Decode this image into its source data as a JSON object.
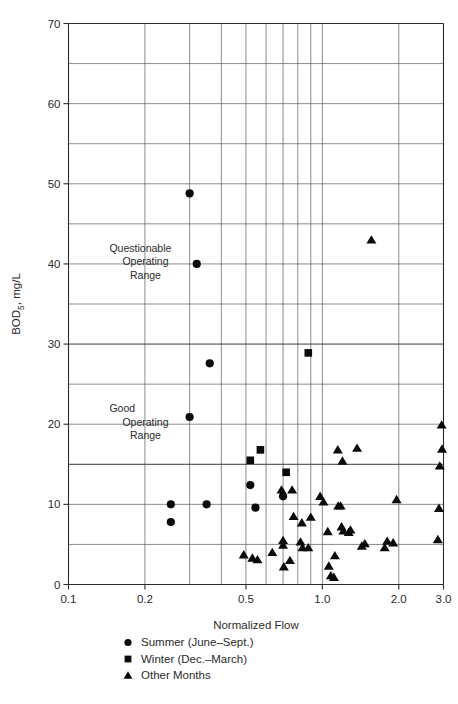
{
  "chart_data": {
    "type": "scatter",
    "title": "",
    "xlabel": "Normalized Flow",
    "ylabel": "BOD5, mg/L",
    "ylabel_display": "BOD₅, mg/L",
    "xscale": "log",
    "yscale": "linear",
    "xlim": [
      0.1,
      3.0
    ],
    "ylim": [
      0,
      70
    ],
    "grid": true,
    "legend_position": "below-axis-center",
    "x_tick_labels": [
      "0.1",
      "0.2",
      "0.5",
      "1.0",
      "2.0",
      "3.0"
    ],
    "x_tick_values": [
      0.1,
      0.2,
      0.5,
      1.0,
      2.0,
      3.0
    ],
    "x_gridline_values": [
      0.1,
      0.2,
      0.3,
      0.4,
      0.5,
      0.6,
      0.7,
      0.8,
      0.9,
      1.0,
      2.0,
      3.0
    ],
    "y_tick_labels": [
      "0",
      "10",
      "20",
      "30",
      "40",
      "50",
      "60",
      "70"
    ],
    "y_tick_values": [
      0,
      10,
      20,
      30,
      40,
      50,
      60,
      70
    ],
    "y_gridline_values": [
      0,
      5,
      10,
      15,
      20,
      25,
      30,
      35,
      40,
      45,
      50,
      55,
      60,
      65,
      70
    ],
    "y_major_gridline_values": [
      15,
      30
    ],
    "annotations": [
      {
        "name": "questionable-operating-range",
        "lines": [
          "Questionable",
          "Operating",
          "Range"
        ],
        "x": 0.145,
        "y_top": 41.5
      },
      {
        "name": "good-operating-range",
        "lines": [
          "Good",
          "Operating",
          "Range"
        ],
        "x": 0.145,
        "y_top": 21.5
      }
    ],
    "legend": [
      {
        "marker": "circle",
        "label": "Summer (June–Sept.)"
      },
      {
        "marker": "square",
        "label": "Winter (Dec.–March)"
      },
      {
        "marker": "triangle",
        "label": "Other Months"
      }
    ],
    "series": [
      {
        "name": "Summer (June–Sept.)",
        "marker": "circle",
        "points": [
          [
            0.253,
            10.0
          ],
          [
            0.253,
            7.8
          ],
          [
            0.3,
            48.8
          ],
          [
            0.32,
            40.0
          ],
          [
            0.35,
            10.0
          ],
          [
            0.36,
            27.6
          ],
          [
            0.3,
            20.9
          ],
          [
            0.52,
            12.4
          ],
          [
            0.545,
            9.6
          ],
          [
            0.7,
            11.0
          ]
        ]
      },
      {
        "name": "Winter (Dec.–March)",
        "marker": "square",
        "points": [
          [
            0.52,
            15.5
          ],
          [
            0.57,
            16.8
          ],
          [
            0.72,
            14.0
          ],
          [
            0.88,
            28.9
          ]
        ]
      },
      {
        "name": "Other Months",
        "marker": "triangle",
        "points": [
          [
            0.49,
            3.7
          ],
          [
            0.53,
            3.3
          ],
          [
            0.555,
            3.1
          ],
          [
            0.635,
            4.0
          ],
          [
            0.69,
            11.8
          ],
          [
            0.7,
            5.5
          ],
          [
            0.7,
            4.9
          ],
          [
            0.705,
            2.2
          ],
          [
            0.76,
            11.8
          ],
          [
            0.77,
            8.5
          ],
          [
            0.745,
            3.0
          ],
          [
            0.82,
            5.3
          ],
          [
            0.835,
            4.6
          ],
          [
            0.83,
            7.7
          ],
          [
            0.88,
            4.6
          ],
          [
            0.9,
            8.4
          ],
          [
            0.98,
            11.0
          ],
          [
            1.01,
            10.3
          ],
          [
            1.05,
            6.6
          ],
          [
            1.06,
            2.3
          ],
          [
            1.08,
            1.1
          ],
          [
            1.11,
            0.9
          ],
          [
            1.12,
            3.6
          ],
          [
            1.15,
            16.8
          ],
          [
            1.155,
            9.8
          ],
          [
            1.18,
            9.8
          ],
          [
            1.19,
            7.2
          ],
          [
            1.2,
            15.4
          ],
          [
            1.21,
            6.7
          ],
          [
            1.27,
            6.5
          ],
          [
            1.29,
            6.8
          ],
          [
            1.37,
            17.0
          ],
          [
            1.43,
            4.8
          ],
          [
            1.47,
            5.1
          ],
          [
            1.76,
            4.6
          ],
          [
            1.8,
            5.4
          ],
          [
            1.9,
            5.2
          ],
          [
            1.96,
            10.6
          ],
          [
            2.85,
            5.6
          ],
          [
            2.88,
            9.5
          ],
          [
            2.9,
            14.8
          ],
          [
            2.95,
            19.9
          ],
          [
            2.96,
            16.9
          ],
          [
            1.56,
            43.0
          ]
        ]
      }
    ]
  },
  "colors": {
    "marker": "#0a0a0a",
    "grid": "#5a5a5a",
    "grid_major": "#3a3a3a",
    "frame": "#2a2a2a",
    "text": "#2b2b2b",
    "background": "#ffffff"
  }
}
